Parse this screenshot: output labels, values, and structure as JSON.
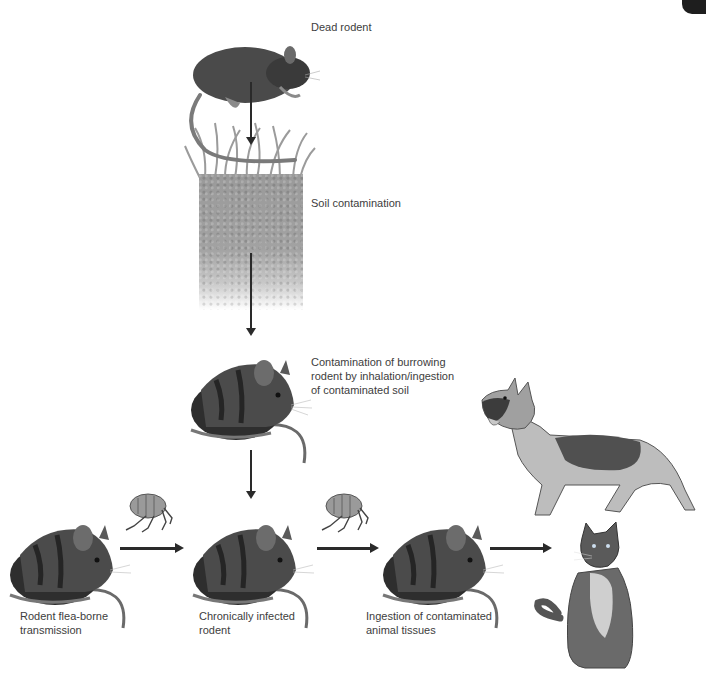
{
  "diagram": {
    "type": "transmission-cycle",
    "corner_tab_color": "#1e1e1e",
    "nodes": [
      {
        "id": "dead-rodent",
        "label": "Dead rodent",
        "icon": "dead-rodent-icon"
      },
      {
        "id": "soil",
        "label": "Soil contamination",
        "icon": "soil-icon"
      },
      {
        "id": "burrowing-rodent",
        "label_lines": [
          "Contamination of burrowing",
          "rodent by inhalation/ingestion",
          "of contaminated soil"
        ],
        "icon": "mouse-icon"
      },
      {
        "id": "flea-rodent",
        "label_lines": [
          "Rodent flea-borne",
          "transmission"
        ],
        "icon": "mouse-icon"
      },
      {
        "id": "chronic-rodent",
        "label_lines": [
          "Chronically infected",
          "rodent"
        ],
        "icon": "mouse-icon"
      },
      {
        "id": "ingestion-rodent",
        "label_lines": [
          "Ingestion of contaminated",
          "animal tissues"
        ],
        "icon": "mouse-icon"
      },
      {
        "id": "dog",
        "label": "",
        "icon": "dog-icon"
      },
      {
        "id": "cat",
        "label": "",
        "icon": "cat-icon"
      }
    ],
    "edges": [
      {
        "from": "dead-rodent",
        "to": "soil"
      },
      {
        "from": "soil",
        "to": "burrowing-rodent"
      },
      {
        "from": "burrowing-rodent",
        "to": "chronic-rodent"
      },
      {
        "from": "flea-rodent",
        "to": "chronic-rodent",
        "via": "flea-icon"
      },
      {
        "from": "chronic-rodent",
        "to": "ingestion-rodent",
        "via": "flea-icon"
      },
      {
        "from": "ingestion-rodent",
        "to": [
          "dog",
          "cat"
        ]
      }
    ]
  },
  "labels": {
    "dead_rodent": "Dead rodent",
    "soil": "Soil contamination",
    "burrowing": [
      "Contamination of burrowing",
      "rodent by inhalation/ingestion",
      "of contaminated soil"
    ],
    "flea_borne": [
      "Rodent flea-borne",
      "transmission"
    ],
    "chronic": [
      "Chronically infected",
      "rodent"
    ],
    "ingestion": [
      "Ingestion of contaminated",
      "animal tissues"
    ]
  }
}
